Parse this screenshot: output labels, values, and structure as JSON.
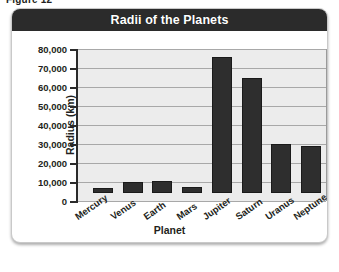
{
  "figure_caption": "Figure 12",
  "chart": {
    "title": "Radii of the Planets",
    "title_bar_color": "#2b2b2b",
    "bar_color": "#2e2e2e",
    "plot_bg_color": "#ececec",
    "gridline_color": "#a8a8a8"
  },
  "chart_data": {
    "type": "bar",
    "title": "Radii of the Planets",
    "xlabel": "Planet",
    "ylabel": "Radius (km)",
    "ylim": [
      0,
      80000
    ],
    "ytick_step": 10000,
    "yticks": [
      0,
      10000,
      20000,
      30000,
      40000,
      50000,
      60000,
      70000,
      80000
    ],
    "ytick_labels": [
      "0",
      "10,000",
      "20,000",
      "30,000",
      "40,000",
      "50,000",
      "60,000",
      "70,000",
      "80,000"
    ],
    "grid": true,
    "legend": false,
    "categories": [
      "Mercury",
      "Venus",
      "Earth",
      "Mars",
      "Jupiter",
      "Saturn",
      "Uranus",
      "Neptune"
    ],
    "values": [
      2440,
      6050,
      6380,
      3400,
      71500,
      60300,
      25600,
      24800
    ]
  }
}
